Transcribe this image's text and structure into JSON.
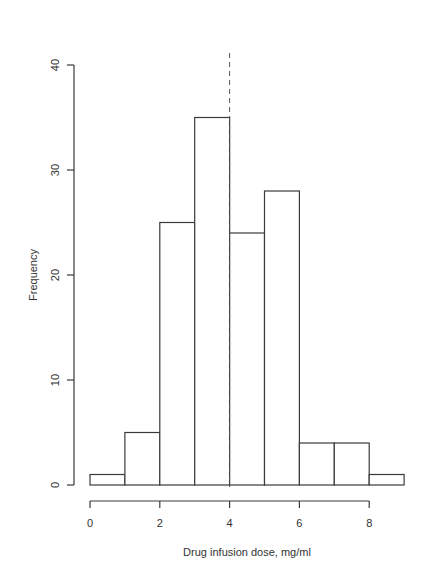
{
  "chart_data": {
    "type": "bar",
    "subtype": "histogram",
    "title": "",
    "xlabel": "Drug infusion dose, mg/ml",
    "ylabel": "Frequency",
    "bins": [
      [
        0,
        1
      ],
      [
        1,
        2
      ],
      [
        2,
        3
      ],
      [
        3,
        4
      ],
      [
        4,
        5
      ],
      [
        5,
        6
      ],
      [
        6,
        7
      ],
      [
        7,
        8
      ],
      [
        8,
        9
      ]
    ],
    "categories": [
      "0-1",
      "1-2",
      "2-3",
      "3-4",
      "4-5",
      "5-6",
      "6-7",
      "7-8",
      "8-9"
    ],
    "values": [
      1,
      5,
      25,
      35,
      24,
      28,
      4,
      4,
      1
    ],
    "xlim": [
      0,
      9
    ],
    "ylim": [
      0,
      40
    ],
    "xticks": [
      0,
      2,
      4,
      6,
      8
    ],
    "yticks": [
      0,
      10,
      20,
      30,
      40
    ],
    "grid": false,
    "legend": null,
    "annotations": [
      {
        "type": "vertical-dashed-line",
        "x": 4,
        "label": ""
      }
    ]
  }
}
